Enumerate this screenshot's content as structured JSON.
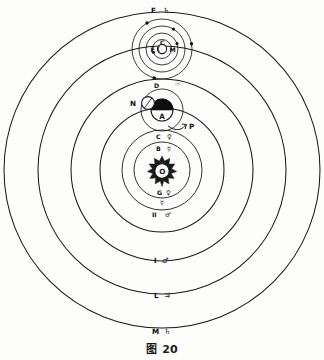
{
  "figure": {
    "caption_prefix": "图",
    "caption_number": "20",
    "center_x": 162,
    "center_y": 170
  },
  "sun": {
    "label": "O",
    "name": "sun",
    "radius": 7
  },
  "orbits": [
    {
      "id": "mercury",
      "label": "B",
      "glyph": "☿",
      "radius": 28,
      "label_x": 158,
      "label_y": 149,
      "glyph_x": 169,
      "glyph_y": 149
    },
    {
      "id": "venus",
      "label": "C",
      "glyph": "♀",
      "radius": 40,
      "label_x": 158,
      "label_y": 137,
      "glyph_x": 169,
      "glyph_y": 137
    },
    {
      "id": "mars",
      "label": "I",
      "glyph": "♂",
      "radius": 91,
      "label_x": 155,
      "label_y": 261,
      "glyph_x": 166,
      "glyph_y": 261
    },
    {
      "id": "jupiter",
      "label": "L",
      "glyph": "♃",
      "radius": 124,
      "label_x": 155,
      "label_y": 296,
      "glyph_x": 166,
      "glyph_y": 296
    },
    {
      "id": "saturn",
      "label": "M",
      "glyph": "♄",
      "radius": 158,
      "label_x": 154,
      "label_y": 332,
      "glyph_x": 165,
      "glyph_y": 332
    }
  ],
  "inner_markers": [
    {
      "id": "venus-inner-lower",
      "label": "G",
      "glyph": "♀",
      "label_x": 158,
      "label_y": 193,
      "glyph_x": 169,
      "glyph_y": 193
    },
    {
      "id": "mercury-inner-lower",
      "label": "",
      "glyph": "☿",
      "label_x": 158,
      "label_y": 203,
      "glyph_x": 166,
      "glyph_y": 203
    },
    {
      "id": "mars-inner-lower",
      "label": "II",
      "glyph": "♂",
      "label_x": 153,
      "label_y": 215,
      "glyph_x": 167,
      "glyph_y": 215
    }
  ],
  "earth": {
    "id": "earth",
    "label": "A",
    "cx": 162,
    "cy": 110,
    "radius": 11,
    "deferent_label": "D",
    "deferent_glyph": "☉",
    "deferent_label_x": 155,
    "deferent_label_y": 87,
    "deferent_glyph_x": 176,
    "deferent_glyph_y": 85
  },
  "moon": {
    "id": "moon",
    "label": "N",
    "cx": 148,
    "cy": 103,
    "radius": 6.5,
    "label_x": 132,
    "label_y": 106
  },
  "pointer": {
    "id": "sun-annual-orbit-pointer",
    "label": "P",
    "label_x": 190,
    "label_y": 128
  },
  "jupiter_system": {
    "id": "jupiter-satellites",
    "cx": 162,
    "cy": 49,
    "primary_label": "C",
    "left_label": "E",
    "right_label": "M",
    "moon_orbit_radii": [
      9,
      15,
      22,
      30
    ],
    "satellites": [
      {
        "id": "satellite-1",
        "angle": 200,
        "orbit": 0
      },
      {
        "id": "satellite-2",
        "angle": 20,
        "orbit": 1
      },
      {
        "id": "satellite-3",
        "angle": 300,
        "orbit": 2
      },
      {
        "id": "satellite-4",
        "angle": 10,
        "orbit": 3
      },
      {
        "id": "satellite-5",
        "angle": 120,
        "orbit": 3
      },
      {
        "id": "satellite-6",
        "angle": 255,
        "orbit": 3
      }
    ]
  },
  "top_label": {
    "id": "saturn-top",
    "label": "F",
    "glyph": "♄",
    "label_x": 152,
    "label_y": 12,
    "glyph_x": 164,
    "glyph_y": 12
  },
  "colors": {
    "ink": "#1a1a1a",
    "paper": "#fdfdfb",
    "shadow": "#0d0d0d"
  }
}
